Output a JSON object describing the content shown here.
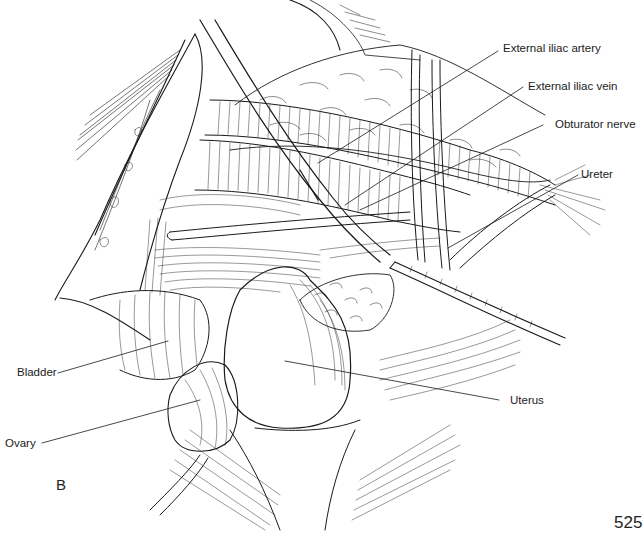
{
  "figure": {
    "panel_letter": "B",
    "page_number": "525",
    "labels": [
      {
        "id": "external-iliac-artery",
        "text": "External iliac artery"
      },
      {
        "id": "external-iliac-vein",
        "text": "External iliac vein"
      },
      {
        "id": "obturator-nerve",
        "text": "Obturator nerve"
      },
      {
        "id": "ureter",
        "text": "Ureter"
      },
      {
        "id": "bladder",
        "text": "Bladder"
      },
      {
        "id": "uterus",
        "text": "Uterus"
      },
      {
        "id": "ovary",
        "text": "Ovary"
      }
    ],
    "colors": {
      "ink": "#1a1a1a",
      "background": "#ffffff"
    }
  }
}
